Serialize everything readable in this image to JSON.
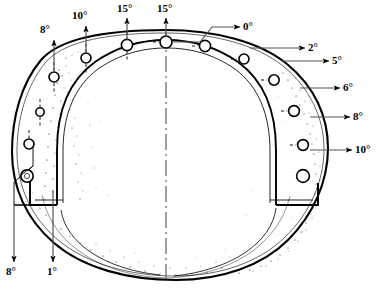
{
  "figure": {
    "type": "engineering-cross-section",
    "background_color": "#ffffff",
    "line_color": "#000000",
    "stipple_color": "#1a1a1a"
  },
  "labels": [
    {
      "id": "deg-8-top-left",
      "text": "8°",
      "x": 48,
      "y": 30,
      "arrow": "up"
    },
    {
      "id": "deg-10-top-left",
      "text": "10°",
      "x": 80,
      "y": 16,
      "arrow": "up"
    },
    {
      "id": "deg-15-left",
      "text": "15°",
      "x": 124,
      "y": 8,
      "arrow": "up"
    },
    {
      "id": "deg-15-center",
      "text": "15°",
      "x": 163,
      "y": 8,
      "arrow": "up"
    },
    {
      "id": "deg-0-right",
      "text": "0°",
      "x": 246,
      "y": 16,
      "arrow": "right"
    },
    {
      "id": "deg-2-right",
      "text": "2°",
      "x": 310,
      "y": 40,
      "arrow": "right"
    },
    {
      "id": "deg-5-right",
      "text": "5°",
      "x": 333,
      "y": 55,
      "arrow": "right"
    },
    {
      "id": "deg-6-right",
      "text": "6°",
      "x": 344,
      "y": 82,
      "arrow": "right"
    },
    {
      "id": "deg-8-right",
      "text": "8°",
      "x": 355,
      "y": 112,
      "arrow": "right"
    },
    {
      "id": "deg-10-right",
      "text": "10°",
      "x": 357,
      "y": 145,
      "arrow": "right"
    },
    {
      "id": "deg-8-bottom",
      "text": "8°",
      "x": 8,
      "y": 268,
      "arrow": "down"
    },
    {
      "id": "deg-1-bottom",
      "text": "1°",
      "x": 48,
      "y": 268,
      "arrow": "down"
    }
  ],
  "holes": [
    {
      "id": "hole-tl-1",
      "cx": 54,
      "cy": 77,
      "r": 5.0
    },
    {
      "id": "hole-tl-2",
      "cx": 59,
      "cy": 112,
      "r": 4.2
    },
    {
      "id": "hole-tl-3",
      "cx": 29,
      "cy": 144,
      "r": 5.0
    },
    {
      "id": "hole-tl-4",
      "cx": 27,
      "cy": 176,
      "r": 6.2
    },
    {
      "id": "hole-top-1",
      "cx": 86,
      "cy": 58,
      "r": 5.0
    },
    {
      "id": "hole-top-2",
      "cx": 127,
      "cy": 45,
      "r": 5.6
    },
    {
      "id": "hole-top-3",
      "cx": 166,
      "cy": 42,
      "r": 6.0
    },
    {
      "id": "hole-top-4",
      "cx": 205,
      "cy": 46,
      "r": 5.6
    },
    {
      "id": "hole-tr-1",
      "cx": 244,
      "cy": 59,
      "r": 5.0
    },
    {
      "id": "hole-tr-2",
      "cx": 274,
      "cy": 80,
      "r": 5.2
    },
    {
      "id": "hole-tr-3",
      "cx": 294,
      "cy": 111,
      "r": 5.4
    },
    {
      "id": "hole-tr-4",
      "cx": 303,
      "cy": 145,
      "r": 5.4
    },
    {
      "id": "hole-tr-5",
      "cx": 303,
      "cy": 176,
      "r": 6.4
    }
  ],
  "geometry": {
    "centerline": {
      "x": 166,
      "y_top": 30,
      "y_bottom": 278
    },
    "outer_shell": "egg-shaped closed contour",
    "inner_cavity": "U-shaped arch open at bottom",
    "stipple_regions": [
      "left-inner-wall",
      "right-outer-wall",
      "bottom-band"
    ]
  }
}
